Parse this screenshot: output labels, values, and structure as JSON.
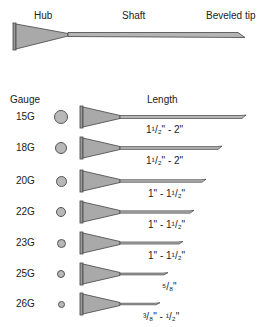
{
  "top_needle": {
    "labels": {
      "hub": "Hub",
      "shaft": "Shaft",
      "tip": "Beveled tip"
    }
  },
  "headers": {
    "gauge": "Gauge",
    "length": "Length"
  },
  "colors": {
    "hub_fill": "#a9a9a9",
    "outline": "#444444",
    "shaft_fill": "#b5b5b5"
  },
  "rows": [
    {
      "gauge": "15G",
      "length": "1¹/₂\" - 2\"",
      "circle_d": 14,
      "tip_x": 246
    },
    {
      "gauge": "18G",
      "length": "1¹/₂\" - 2\"",
      "circle_d": 12,
      "tip_x": 222
    },
    {
      "gauge": "20G",
      "length": "1\" - 1¹/₂\"",
      "circle_d": 11,
      "tip_x": 206
    },
    {
      "gauge": "22G",
      "length": "1\" - 1¹/₂\"",
      "circle_d": 10,
      "tip_x": 194
    },
    {
      "gauge": "23G",
      "length": "1\" - 1¹/₂\"",
      "circle_d": 9,
      "tip_x": 183
    },
    {
      "gauge": "25G",
      "length": "⁵/₈\"",
      "circle_d": 8,
      "tip_x": 168
    },
    {
      "gauge": "26G",
      "length": "³/₈\" - ¹/₂\"",
      "circle_d": 7,
      "tip_x": 160
    }
  ]
}
